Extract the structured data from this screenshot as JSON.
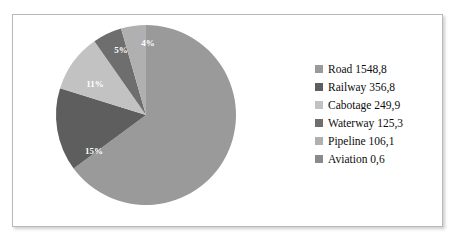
{
  "chart_data": {
    "type": "pie",
    "title": "",
    "legend_position": "right",
    "start_angle_deg": 0,
    "direction": "clockwise",
    "categories": [
      "Road",
      "Railway",
      "Cabotage",
      "Waterway",
      "Pipeline",
      "Aviation"
    ],
    "values": [
      1548.8,
      356.8,
      249.9,
      125.3,
      106.1,
      0.6
    ],
    "value_strings": [
      "1548,8",
      "356,8",
      "249,9",
      "125,3",
      "106,1",
      "0,6"
    ],
    "percent_labels": [
      "65%",
      "15%",
      "11%",
      "5%",
      "4%",
      ""
    ],
    "percents": [
      65,
      15,
      11,
      5,
      4,
      0
    ],
    "colors": [
      "#9a9a9a",
      "#5e5e5e",
      "#c2c2c2",
      "#6e6e6e",
      "#b0b0b0",
      "#8a8a8a"
    ],
    "legend": [
      {
        "label": "Road 1548,8",
        "color": "#9a9a9a"
      },
      {
        "label": "Railway 356,8",
        "color": "#5e5e5e"
      },
      {
        "label": "Cabotage 249,9",
        "color": "#c2c2c2"
      },
      {
        "label": "Waterway 125,3",
        "color": "#6e6e6e"
      },
      {
        "label": "Pipeline 106,1",
        "color": "#b0b0b0"
      },
      {
        "label": "Aviation 0,6",
        "color": "#8a8a8a"
      }
    ],
    "slices": [
      {
        "name": "Road",
        "percent_label": "65%",
        "label_x": 133,
        "label_y": 135,
        "color": "#9a9a9a"
      },
      {
        "name": "Railway",
        "percent_label": "15%",
        "label_x": -52,
        "label_y": 37,
        "color": "#5e5e5e"
      },
      {
        "name": "Cabotage",
        "percent_label": "11%",
        "label_x": -51,
        "label_y": -30,
        "color": "#c2c2c2"
      },
      {
        "name": "Waterway",
        "percent_label": "5%",
        "label_x": -25,
        "label_y": -64,
        "color": "#6e6e6e"
      },
      {
        "name": "Pipeline",
        "percent_label": "4%",
        "label_x": 2,
        "label_y": -71,
        "color": "#b0b0b0"
      }
    ]
  },
  "frame": {
    "border_color": "#b9b9b9",
    "background": "#ffffff"
  }
}
